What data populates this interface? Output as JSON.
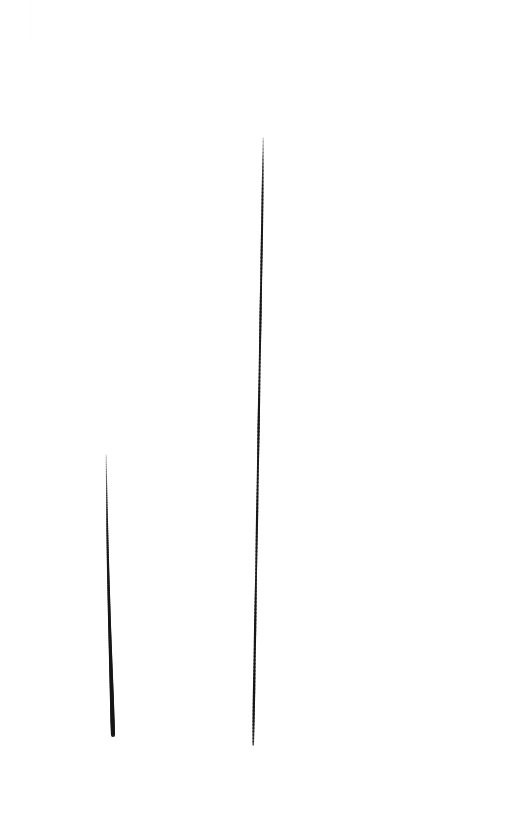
{
  "image": {
    "title": "Two Vertical Ink Strokes",
    "width": 506,
    "height": 820,
    "background_color": "#ffffff",
    "medium": "ink-on-paper",
    "subject_count": "2"
  },
  "chart_data": {
    "type": "line",
    "title": "Two Vertical Ink Strokes",
    "xlabel": "",
    "ylabel": "",
    "xlim": [
      0,
      506
    ],
    "ylim": [
      0,
      820
    ],
    "grid": false,
    "legend": "none",
    "series": [
      {
        "name": "left-stroke",
        "label": "Short left stroke",
        "color": "#161616",
        "x": [
          106.2,
          106.4,
          106.7,
          107.0,
          107.3,
          107.7,
          108.1,
          108.6,
          109.1,
          109.6,
          110.2,
          110.8,
          111.4,
          112.0,
          112.5,
          113.0
        ],
        "y": [
          455,
          474,
          493,
          512,
          531,
          550,
          569,
          588,
          607,
          626,
          645,
          664,
          683,
          702,
          720,
          735
        ],
        "width": [
          0.7,
          1.0,
          1.3,
          1.6,
          1.9,
          2.1,
          2.3,
          2.5,
          2.7,
          2.9,
          3.1,
          3.4,
          3.7,
          4.0,
          4.2,
          4.1
        ],
        "opacity": [
          0.3,
          0.52,
          0.7,
          0.82,
          0.9,
          0.94,
          0.96,
          0.97,
          0.98,
          0.99,
          1.0,
          1.0,
          1.0,
          1.0,
          1.0,
          0.97
        ],
        "length_px": 280,
        "top_point": [
          106,
          455
        ],
        "bottom_point": [
          113,
          735
        ]
      },
      {
        "name": "right-stroke",
        "label": "Long right stroke",
        "color": "#161616",
        "x": [
          263.2,
          262.9,
          262.5,
          262.1,
          261.6,
          261.1,
          260.6,
          260.1,
          259.6,
          259.1,
          258.6,
          258.1,
          257.6,
          257.1,
          256.6,
          256.1,
          255.6,
          255.1,
          254.6,
          254.1,
          253.6,
          253.2
        ],
        "y": [
          138,
          167,
          196,
          225,
          254,
          283,
          312,
          341,
          370,
          399,
          428,
          457,
          486,
          515,
          544,
          573,
          602,
          631,
          660,
          689,
          718,
          745
        ],
        "width": [
          0.8,
          1.5,
          1.9,
          2.0,
          2.1,
          1.9,
          2.2,
          2.0,
          1.8,
          2.1,
          2.3,
          2.0,
          1.9,
          2.2,
          2.0,
          1.8,
          2.1,
          2.3,
          2.1,
          2.4,
          2.2,
          1.6
        ],
        "opacity": [
          0.35,
          0.75,
          0.92,
          0.96,
          0.98,
          0.94,
          1.0,
          0.96,
          0.9,
          0.97,
          1.0,
          0.95,
          0.92,
          0.98,
          0.95,
          0.9,
          0.97,
          1.0,
          0.96,
          1.0,
          0.98,
          0.7
        ],
        "length_px": 607,
        "top_point": [
          263,
          138
        ],
        "bottom_point": [
          253,
          745
        ]
      }
    ],
    "annotations": [
      {
        "name": "faint-top-artifact",
        "x": 30,
        "y_start": 0,
        "y_end": 45,
        "color": "#fcfcfc",
        "opacity": "0.04"
      }
    ]
  }
}
